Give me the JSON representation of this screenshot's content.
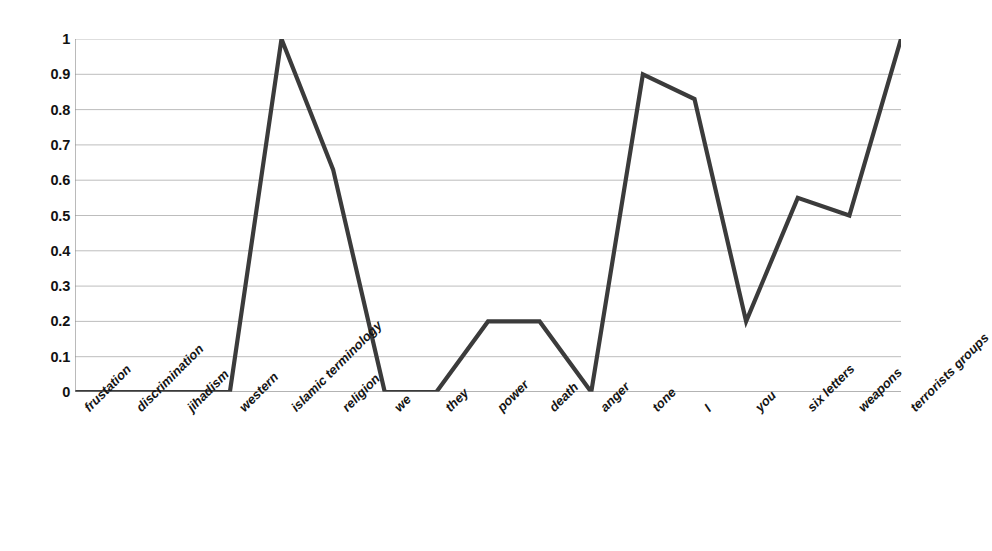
{
  "chart_data": {
    "type": "line",
    "title": "",
    "xlabel": "",
    "ylabel": "",
    "ylim": [
      0,
      1
    ],
    "xlim_categories": 17,
    "grid": true,
    "legend": false,
    "legend_position": "none",
    "line_color": "#3b3b3b",
    "grid_color": "#b5b5b5",
    "axis_color": "#8c8c8c",
    "background": "#ffffff",
    "y_ticks": [
      "0",
      "0.1",
      "0.2",
      "0.3",
      "0.4",
      "0.5",
      "0.6",
      "0.7",
      "0.8",
      "0.9",
      "1"
    ],
    "y_tick_values": [
      0,
      0.1,
      0.2,
      0.3,
      0.4,
      0.5,
      0.6,
      0.7,
      0.8,
      0.9,
      1
    ],
    "categories": [
      "frustation",
      "discrimination",
      "jihadism",
      "western",
      "islamic terminology",
      "religion",
      "we",
      "they",
      "power",
      "death",
      "anger",
      "tone",
      "I",
      "you",
      "six letters",
      "weapons",
      "terrorists groups"
    ],
    "values": [
      0,
      0,
      0,
      0,
      1,
      0.63,
      0,
      0,
      0.2,
      0.2,
      0,
      0.9,
      0.83,
      0.2,
      0.55,
      0.5,
      1
    ],
    "series": [
      {
        "name": "series-1",
        "values": [
          0,
          0,
          0,
          0,
          1,
          0.63,
          0,
          0,
          0.2,
          0.2,
          0,
          0.9,
          0.83,
          0.2,
          0.55,
          0.5,
          1
        ]
      }
    ]
  }
}
